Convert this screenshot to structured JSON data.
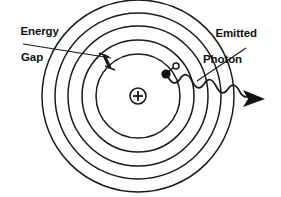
{
  "figure": {
    "background_color": "#ffffff",
    "stroke_color": "#1a1a1a",
    "width": 281,
    "height": 197
  },
  "labels": {
    "energy_gap": {
      "line1": "Energy",
      "line2": "Gap"
    },
    "emitted_photon": {
      "line1": "Emitted",
      "line2": "Photon"
    }
  },
  "nucleus": {
    "charge_symbol": "+",
    "center_x": 138,
    "center_y": 96,
    "radius": 8
  },
  "orbits": {
    "count": 5,
    "center_x": 138,
    "center_y": 96,
    "radii": [
      42,
      56,
      70,
      83,
      96
    ]
  },
  "electron": {
    "symbol": "filled-dot",
    "x": 166,
    "y": 74,
    "radius": 4.5
  },
  "electron_ghost": {
    "symbol": "open-dot",
    "x": 176,
    "y": 66,
    "radius": 3
  },
  "energy_gap_marker": {
    "from_x": 104,
    "from_y": 54,
    "to_x": 110,
    "to_y": 69
  },
  "photon": {
    "symbol": "wavy-arrow",
    "start_x": 168,
    "start_y": 76,
    "arrow_tip_x": 265,
    "arrow_tip_y": 99,
    "wave_count": 4
  },
  "leader_lines": {
    "energy_gap": {
      "x1": 23,
      "y1": 44,
      "x2": 112,
      "y2": 58
    },
    "emitted_photon": {
      "x1": 246,
      "y1": 48,
      "x2": 197,
      "y2": 81
    }
  }
}
